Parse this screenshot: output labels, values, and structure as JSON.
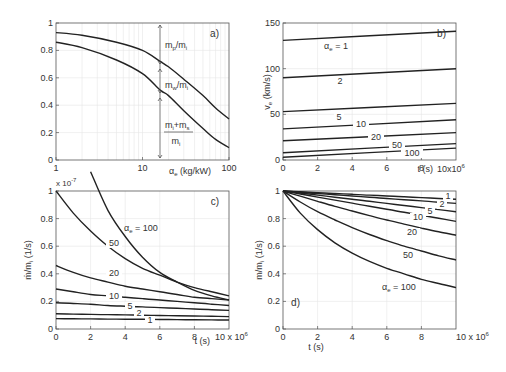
{
  "chart_data": [
    {
      "panel": "a)",
      "type": "line",
      "xscale": "log",
      "xlabel": "α_e (kg/kW)",
      "ylabel": "",
      "xlim": [
        1,
        100
      ],
      "ylim": [
        0,
        1
      ],
      "xticks": [
        "1",
        "10",
        "100"
      ],
      "yticks": [
        "0",
        "0.2",
        "0.4",
        "0.6",
        "0.8",
        "1"
      ],
      "grid": true,
      "x": [
        1,
        2,
        5,
        10,
        16,
        20,
        30,
        50,
        70,
        100
      ],
      "series": [
        {
          "name": "upper",
          "values": [
            0.93,
            0.91,
            0.86,
            0.8,
            0.72,
            0.68,
            0.59,
            0.47,
            0.38,
            0.3
          ]
        },
        {
          "name": "lower",
          "values": [
            0.86,
            0.82,
            0.73,
            0.63,
            0.51,
            0.47,
            0.36,
            0.23,
            0.15,
            0.09
          ]
        }
      ],
      "annotations": [
        {
          "text": "m_p/m_i",
          "region": "between 1 and upper curve"
        },
        {
          "text": "m_w/m_i",
          "region": "between upper and lower curve"
        },
        {
          "text": "(m_i+m_s)/m_i",
          "region": "below lower curve"
        },
        {
          "text": "vertical arrow at α_e ≈ 16"
        }
      ]
    },
    {
      "panel": "b)",
      "type": "line",
      "xlabel": "t (s)",
      "ylabel": "v_e (km/s)",
      "xlim": [
        0,
        10
      ],
      "xmultiplier": "10x10^6",
      "ylim": [
        0,
        150
      ],
      "xticks": [
        "0",
        "2",
        "4",
        "6",
        "8"
      ],
      "yticks": [
        "0",
        "50",
        "100",
        "150"
      ],
      "grid": true,
      "x": [
        0,
        10
      ],
      "series": [
        {
          "name": "α_e = 1",
          "values": [
            131,
            141
          ]
        },
        {
          "name": "2",
          "values": [
            90,
            100
          ]
        },
        {
          "name": "5",
          "values": [
            53,
            62
          ]
        },
        {
          "name": "10",
          "values": [
            34,
            44
          ]
        },
        {
          "name": "20",
          "values": [
            21,
            30
          ]
        },
        {
          "name": "50",
          "values": [
            8,
            18
          ]
        },
        {
          "name": "100",
          "values": [
            3,
            13
          ]
        }
      ]
    },
    {
      "panel": "c)",
      "type": "line",
      "xlabel": "t (s)",
      "ylabel": "ṁ/m_i (1/s)",
      "yexponent": "x 10^-7",
      "xmultiplier": "10 x 10^6",
      "xlim": [
        0,
        10
      ],
      "ylim": [
        0,
        1
      ],
      "xticks": [
        "0",
        "2",
        "4",
        "6",
        "8"
      ],
      "yticks": [
        "0",
        "0.2",
        "0.4",
        "0.6",
        "0.8",
        "1"
      ],
      "grid": true,
      "x": [
        0,
        1,
        2,
        3,
        4,
        5,
        6,
        7,
        8,
        9,
        10
      ],
      "series": [
        {
          "name": "α_e = 100",
          "values": [
            null,
            null,
            1.14,
            0.86,
            0.67,
            0.52,
            0.41,
            0.34,
            0.28,
            0.24,
            0.21
          ]
        },
        {
          "name": "50",
          "values": [
            1.0,
            0.84,
            0.71,
            0.6,
            0.51,
            0.44,
            0.39,
            0.34,
            0.3,
            0.27,
            0.24
          ]
        },
        {
          "name": "20",
          "values": [
            0.46,
            0.41,
            0.37,
            0.34,
            0.31,
            0.29,
            0.27,
            0.25,
            0.23,
            0.22,
            0.21
          ]
        },
        {
          "name": "10",
          "values": [
            0.29,
            0.27,
            0.25,
            0.24,
            0.23,
            0.22,
            0.21,
            0.2,
            0.19,
            0.18,
            0.17
          ]
        },
        {
          "name": "5",
          "values": [
            0.19,
            0.185,
            0.18,
            0.17,
            0.165,
            0.16,
            0.155,
            0.15,
            0.145,
            0.14,
            0.135
          ]
        },
        {
          "name": "2",
          "values": [
            0.11,
            0.108,
            0.106,
            0.104,
            0.102,
            0.1,
            0.098,
            0.096,
            0.094,
            0.092,
            0.09
          ]
        },
        {
          "name": "1",
          "values": [
            0.075,
            0.074,
            0.073,
            0.072,
            0.071,
            0.07,
            0.069,
            0.068,
            0.067,
            0.066,
            0.065
          ]
        }
      ]
    },
    {
      "panel": "d)",
      "type": "line",
      "xlabel": "t (s)",
      "ylabel": "m/m_i (1/s)",
      "xmultiplier": "10 x 10^6",
      "xlim": [
        0,
        10
      ],
      "ylim": [
        0,
        1
      ],
      "xticks": [
        "0",
        "2",
        "4",
        "6",
        "8"
      ],
      "yticks": [
        "0",
        "0.2",
        "0.4",
        "0.6",
        "0.8",
        "1"
      ],
      "grid": true,
      "x": [
        0,
        1,
        2,
        3,
        4,
        5,
        6,
        7,
        8,
        9,
        10
      ],
      "series": [
        {
          "name": "1",
          "values": [
            1,
            0.994,
            0.988,
            0.982,
            0.976,
            0.97,
            0.964,
            0.958,
            0.952,
            0.946,
            0.94
          ]
        },
        {
          "name": "2",
          "values": [
            1,
            0.991,
            0.982,
            0.973,
            0.964,
            0.955,
            0.946,
            0.937,
            0.928,
            0.919,
            0.91
          ]
        },
        {
          "name": "5",
          "values": [
            1,
            0.985,
            0.97,
            0.955,
            0.94,
            0.925,
            0.91,
            0.895,
            0.88,
            0.865,
            0.85
          ]
        },
        {
          "name": "10",
          "values": [
            1,
            0.978,
            0.956,
            0.934,
            0.912,
            0.89,
            0.868,
            0.846,
            0.824,
            0.802,
            0.78
          ]
        },
        {
          "name": "20",
          "values": [
            1,
            0.962,
            0.925,
            0.889,
            0.855,
            0.822,
            0.79,
            0.76,
            0.731,
            0.704,
            0.68
          ]
        },
        {
          "name": "50",
          "values": [
            1,
            0.92,
            0.85,
            0.79,
            0.735,
            0.685,
            0.64,
            0.6,
            0.565,
            0.53,
            0.5
          ]
        },
        {
          "name": "α_e = 100",
          "values": [
            1,
            0.84,
            0.72,
            0.625,
            0.55,
            0.49,
            0.44,
            0.4,
            0.36,
            0.33,
            0.3
          ]
        }
      ]
    }
  ]
}
